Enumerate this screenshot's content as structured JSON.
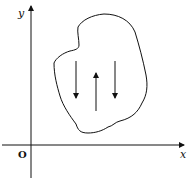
{
  "diagram": {
    "axes": {
      "x_label": "x",
      "y_label": "y",
      "origin_label": "O"
    },
    "region": {
      "shape": "irregular closed curve"
    },
    "arrows": [
      {
        "direction": "down",
        "position": "left"
      },
      {
        "direction": "up",
        "position": "center"
      },
      {
        "direction": "down",
        "position": "right"
      }
    ],
    "colors": {
      "stroke": "#111111",
      "background": "#ffffff"
    }
  }
}
